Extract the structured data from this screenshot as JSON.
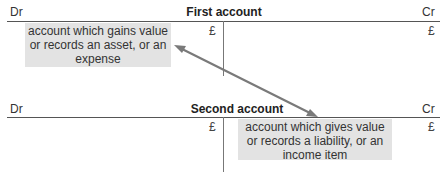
{
  "first_account": {
    "title": "First account",
    "dr_label": "Dr",
    "cr_label": "Cr",
    "dr_currency": "£",
    "cr_currency": "£",
    "note_lines": [
      "account which gains value",
      "or records an asset, or an",
      "expense"
    ]
  },
  "second_account": {
    "title": "Second account",
    "dr_label": "Dr",
    "cr_label": "Cr",
    "dr_currency": "£",
    "cr_currency": "£",
    "note_lines": [
      "account which gives value",
      "or records a liability, or an",
      "income item"
    ]
  },
  "colors": {
    "note_background": "#e3e3e3",
    "arrow": "#7a7a7a",
    "rule": "#555555"
  }
}
